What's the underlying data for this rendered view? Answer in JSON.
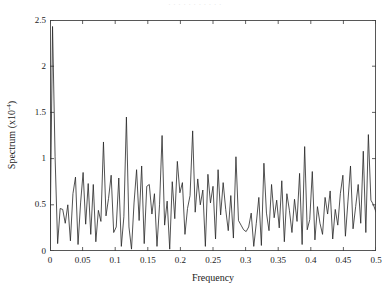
{
  "figure": {
    "background_color": "#ffffff",
    "line_color": "#262626",
    "axis_color": "#3a3a3a",
    "top_artifact_text": "· · ·   · ·   · ·     · ·      · ·"
  },
  "chart_data": {
    "type": "line",
    "title": "",
    "subtitle": "",
    "xlabel": "Frequency",
    "ylabel": "Spectrum (x10^-4)",
    "ylabel_plain": "Spectrum (x10",
    "ylabel_exponent": "-4",
    "ylabel_suffix": ")",
    "xlim": [
      0,
      0.5
    ],
    "ylim": [
      0,
      2.5
    ],
    "xticks": [
      0,
      0.05,
      0.1,
      0.15,
      0.2,
      0.25,
      0.3,
      0.35,
      0.4,
      0.45,
      0.5
    ],
    "xtick_labels": [
      "0",
      "0.05",
      "0.1",
      "0.15",
      "0.2",
      "0.25",
      "0.3",
      "0.35",
      "0.4",
      "0.45",
      "0.5"
    ],
    "yticks": [
      0,
      0.5,
      1,
      1.5,
      2,
      2.5
    ],
    "ytick_labels": [
      "0",
      "0.5",
      "1",
      "1.5",
      "2",
      "2.5"
    ],
    "grid": false,
    "legend": null,
    "legend_position": "none",
    "tick_direction": "in",
    "box": true,
    "series": [
      {
        "name": "Spectrum",
        "color": "#262626",
        "line_width": 0.8,
        "x": [
          0.0,
          0.0039,
          0.0078,
          0.0117,
          0.0156,
          0.0195,
          0.0234,
          0.0273,
          0.0313,
          0.0352,
          0.0391,
          0.043,
          0.0469,
          0.0508,
          0.0547,
          0.0586,
          0.0625,
          0.0664,
          0.0703,
          0.0742,
          0.0781,
          0.082,
          0.0859,
          0.0898,
          0.0938,
          0.0977,
          0.1016,
          0.1055,
          0.1094,
          0.1133,
          0.1172,
          0.1211,
          0.125,
          0.1289,
          0.1328,
          0.1367,
          0.1406,
          0.1445,
          0.1484,
          0.1523,
          0.1563,
          0.1602,
          0.1641,
          0.168,
          0.1719,
          0.1758,
          0.1797,
          0.1836,
          0.1875,
          0.1914,
          0.1953,
          0.1992,
          0.2031,
          0.207,
          0.2109,
          0.2148,
          0.2188,
          0.2227,
          0.2266,
          0.2305,
          0.2344,
          0.2383,
          0.2422,
          0.2461,
          0.25,
          0.2539,
          0.2578,
          0.2617,
          0.2656,
          0.2695,
          0.2734,
          0.2773,
          0.2813,
          0.2852,
          0.2891,
          0.293,
          0.2969,
          0.3008,
          0.3047,
          0.3086,
          0.3125,
          0.3164,
          0.3203,
          0.3242,
          0.3281,
          0.332,
          0.3359,
          0.3398,
          0.3438,
          0.3477,
          0.3516,
          0.3555,
          0.3594,
          0.3633,
          0.3672,
          0.3711,
          0.375,
          0.3789,
          0.3828,
          0.3867,
          0.3906,
          0.3945,
          0.3984,
          0.4023,
          0.4063,
          0.4102,
          0.4141,
          0.418,
          0.4219,
          0.4258,
          0.4297,
          0.4336,
          0.4375,
          0.4414,
          0.4453,
          0.4492,
          0.4531,
          0.457,
          0.4609,
          0.4648,
          0.4688,
          0.4727,
          0.4766,
          0.4805,
          0.4844,
          0.4883,
          0.4922,
          0.4961,
          0.5
        ],
        "y": [
          0.03,
          2.43,
          1.02,
          0.08,
          0.46,
          0.45,
          0.3,
          0.5,
          0.11,
          0.62,
          0.8,
          0.07,
          0.52,
          0.85,
          0.29,
          0.73,
          0.18,
          0.72,
          0.1,
          0.44,
          0.32,
          1.18,
          0.38,
          0.57,
          0.82,
          0.2,
          0.26,
          0.79,
          0.05,
          0.37,
          1.45,
          0.26,
          0.02,
          0.52,
          0.88,
          0.33,
          0.92,
          0.08,
          0.7,
          0.72,
          0.4,
          0.62,
          0.05,
          0.5,
          1.25,
          0.28,
          0.54,
          0.02,
          0.75,
          0.35,
          0.97,
          0.63,
          0.74,
          0.18,
          0.46,
          0.6,
          1.3,
          0.42,
          0.78,
          0.5,
          0.66,
          0.05,
          0.83,
          0.52,
          0.7,
          0.13,
          0.88,
          0.39,
          0.74,
          0.45,
          0.22,
          0.6,
          0.14,
          1.02,
          0.33,
          0.28,
          0.23,
          0.21,
          0.26,
          0.41,
          0.05,
          0.3,
          0.58,
          0.06,
          0.95,
          0.41,
          0.22,
          0.72,
          0.36,
          0.55,
          0.25,
          0.76,
          0.1,
          0.62,
          0.44,
          0.2,
          0.56,
          0.32,
          0.84,
          0.07,
          1.13,
          0.23,
          0.34,
          0.86,
          0.12,
          0.48,
          0.3,
          0.18,
          0.58,
          0.4,
          0.65,
          0.13,
          0.45,
          0.28,
          0.62,
          0.82,
          0.16,
          0.54,
          0.92,
          0.24,
          0.48,
          0.72,
          0.3,
          1.08,
          0.2,
          1.26,
          0.55,
          0.5,
          0.42
        ]
      }
    ]
  }
}
